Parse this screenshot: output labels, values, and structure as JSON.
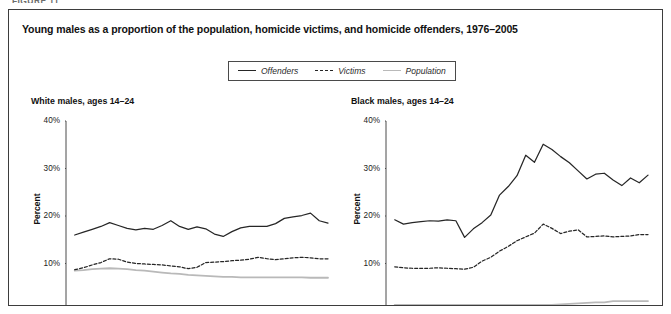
{
  "figure_kicker": "FIGURE 11",
  "figure": {
    "title": "Young males as a proportion of the population, homicide victims, and homicide offenders, 1976–2005"
  },
  "legend": {
    "position": "top-center",
    "items": [
      {
        "label": "Offenders",
        "style": "solid",
        "color": "#262626",
        "icon": "line-solid-icon"
      },
      {
        "label": "Victims",
        "style": "dashed",
        "color": "#262626",
        "icon": "line-dashed-icon"
      },
      {
        "label": "Population",
        "style": "solid",
        "color": "#b9b9b9",
        "icon": "line-light-icon"
      }
    ]
  },
  "chart_data": [
    {
      "type": "line",
      "title": "White males, ages 14–24",
      "xlabel": "",
      "ylabel": "Percent",
      "xlim": [
        1975,
        2005
      ],
      "ylim": [
        0,
        40
      ],
      "grid": false,
      "xticks": [
        1975,
        1980,
        1985,
        1990,
        1995,
        2000,
        2005
      ],
      "yticks": [
        0,
        10,
        20,
        30,
        40
      ],
      "ytick_labels": [
        "0%",
        "10%",
        "20%",
        "30%",
        "40%"
      ],
      "xtick_labels": [
        "1975",
        "1980",
        "1985",
        "1990",
        "1995",
        "2000",
        "2005"
      ],
      "x": [
        1976,
        1977,
        1978,
        1979,
        1980,
        1981,
        1982,
        1983,
        1984,
        1985,
        1986,
        1987,
        1988,
        1989,
        1990,
        1991,
        1992,
        1993,
        1994,
        1995,
        1996,
        1997,
        1998,
        1999,
        2000,
        2001,
        2002,
        2003,
        2004,
        2005
      ],
      "series": [
        {
          "name": "Offenders",
          "style": "solid",
          "color": "#262626",
          "values": [
            16.0,
            16.6,
            17.2,
            17.8,
            18.6,
            18.0,
            17.4,
            17.1,
            17.4,
            17.2,
            18.0,
            19.0,
            17.8,
            17.2,
            17.7,
            17.3,
            16.2,
            15.7,
            16.7,
            17.5,
            17.8,
            17.8,
            17.8,
            18.4,
            19.5,
            19.8,
            20.1,
            20.6,
            19.0,
            18.5
          ]
        },
        {
          "name": "Victims",
          "style": "dashed",
          "color": "#262626",
          "values": [
            8.7,
            9.1,
            9.7,
            10.2,
            11.0,
            10.9,
            10.3,
            10.0,
            9.9,
            9.8,
            9.7,
            9.5,
            9.3,
            8.9,
            9.2,
            10.2,
            10.3,
            10.4,
            10.6,
            10.7,
            10.9,
            11.3,
            11.0,
            10.8,
            11.0,
            11.2,
            11.3,
            11.2,
            11.0,
            11.0
          ]
        },
        {
          "name": "Population",
          "style": "solid",
          "color": "#b9b9b9",
          "values": [
            8.5,
            8.6,
            8.8,
            8.9,
            9.0,
            8.9,
            8.8,
            8.6,
            8.5,
            8.3,
            8.1,
            7.9,
            7.8,
            7.6,
            7.5,
            7.4,
            7.3,
            7.2,
            7.2,
            7.1,
            7.1,
            7.1,
            7.1,
            7.1,
            7.1,
            7.1,
            7.1,
            7.0,
            7.0,
            7.0
          ]
        }
      ]
    },
    {
      "type": "line",
      "title": "Black males, ages 14–24",
      "xlabel": "",
      "ylabel": "Percent",
      "xlim": [
        1975,
        2005
      ],
      "ylim": [
        0,
        40
      ],
      "grid": false,
      "xticks": [
        1975,
        1980,
        1985,
        1990,
        1995,
        2000,
        2005
      ],
      "yticks": [
        0,
        10,
        20,
        30,
        40
      ],
      "ytick_labels": [
        "0%",
        "10%",
        "20%",
        "30%",
        "40%"
      ],
      "xtick_labels": [
        "1975",
        "1980",
        "1985",
        "1990",
        "1995",
        "2000",
        "2005"
      ],
      "x": [
        1976,
        1977,
        1978,
        1979,
        1980,
        1981,
        1982,
        1983,
        1984,
        1985,
        1986,
        1987,
        1988,
        1989,
        1990,
        1991,
        1992,
        1993,
        1994,
        1995,
        1996,
        1997,
        1998,
        1999,
        2000,
        2001,
        2002,
        2003,
        2004,
        2005
      ],
      "series": [
        {
          "name": "Offenders",
          "style": "solid",
          "color": "#262626",
          "values": [
            19.2,
            18.3,
            18.6,
            18.8,
            19.0,
            18.9,
            19.2,
            19.0,
            15.5,
            17.3,
            18.6,
            20.2,
            24.4,
            26.2,
            28.5,
            32.8,
            31.3,
            35.1,
            34.0,
            32.5,
            31.2,
            29.5,
            27.8,
            28.8,
            29.0,
            27.6,
            26.4,
            28.0,
            27.0,
            28.6
          ]
        },
        {
          "name": "Victims",
          "style": "dashed",
          "color": "#262626",
          "values": [
            9.3,
            9.1,
            9.0,
            9.0,
            9.0,
            9.1,
            9.0,
            8.9,
            8.8,
            9.2,
            10.5,
            11.3,
            12.6,
            13.6,
            14.8,
            15.6,
            16.4,
            18.3,
            17.4,
            16.3,
            16.8,
            17.1,
            15.6,
            15.7,
            15.8,
            15.6,
            15.7,
            15.8,
            16.1,
            16.1
          ]
        },
        {
          "name": "Population",
          "style": "solid",
          "color": "#b9b9b9",
          "values": [
            1.3,
            1.3,
            1.3,
            1.3,
            1.3,
            1.3,
            1.3,
            1.3,
            1.3,
            1.3,
            1.3,
            1.3,
            1.3,
            1.3,
            1.3,
            1.3,
            1.3,
            1.3,
            1.3,
            1.4,
            1.5,
            1.6,
            1.7,
            1.8,
            1.8,
            2.1,
            2.1,
            2.1,
            2.1,
            2.1
          ]
        }
      ]
    }
  ]
}
